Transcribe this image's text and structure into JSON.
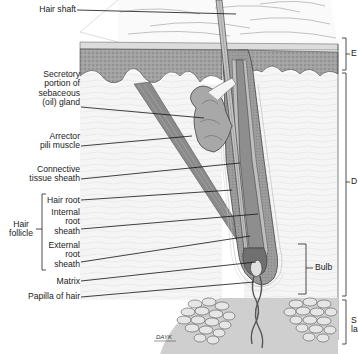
{
  "diagram": {
    "colors": {
      "epidermis_fill": "#9a9a9a",
      "stratum_corneum": "#d4d4d4",
      "dermis_fill": "#f4f4f4",
      "hypodermis_fill": "#c8c8c8",
      "fat_cells_fill": "#dcdcdc",
      "follicle_dark": "#6e6e6e",
      "follicle_mid": "#a4a4a4",
      "outline": "#333333",
      "leader_line": "#111111"
    },
    "left_labels": [
      {
        "id": "hair-shaft",
        "lines": [
          "Hair shaft"
        ]
      },
      {
        "id": "sebaceous-gland",
        "lines": [
          "Secretory",
          "portion of",
          "sebaceous",
          "(oil) gland"
        ]
      },
      {
        "id": "arrector-pili",
        "lines": [
          "Arrector",
          "pili muscle"
        ]
      },
      {
        "id": "connective-tissue-sheath",
        "lines": [
          "Connective",
          "tissue sheath"
        ]
      },
      {
        "id": "hair-root",
        "lines": [
          "Hair root"
        ]
      },
      {
        "id": "internal-root-sheath",
        "lines": [
          "Internal",
          "root",
          "sheath"
        ]
      },
      {
        "id": "external-root-sheath",
        "lines": [
          "External",
          "root",
          "sheath"
        ]
      },
      {
        "id": "matrix",
        "lines": [
          "Matrix"
        ]
      },
      {
        "id": "papilla",
        "lines": [
          "Papilla of hair"
        ]
      }
    ],
    "group_label": {
      "id": "hair-follicle",
      "lines": [
        "Hair",
        "follicle"
      ]
    },
    "right_labels": [
      {
        "id": "epidermis",
        "text": "E"
      },
      {
        "id": "dermis",
        "text": "D"
      },
      {
        "id": "bulb",
        "text": "Bulb"
      },
      {
        "id": "subcutaneous-1",
        "text": "S"
      },
      {
        "id": "subcutaneous-2",
        "text": "la"
      }
    ],
    "signature": "DAYK"
  }
}
